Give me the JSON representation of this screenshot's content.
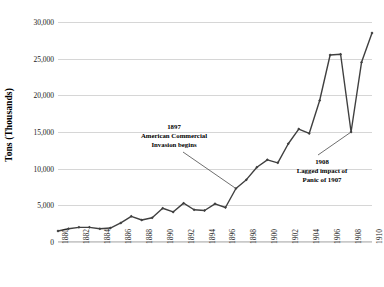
{
  "chart_data": {
    "type": "line",
    "title": "",
    "xlabel": "",
    "ylabel": "Tons (Thousands)",
    "ylim": [
      0,
      30000
    ],
    "xlim": [
      1880,
      1910
    ],
    "grid": true,
    "legend": "none",
    "y_ticks": [
      0,
      5000,
      10000,
      15000,
      20000,
      25000,
      30000
    ],
    "y_tick_labels": [
      "0",
      "5,000",
      "10,000",
      "15,000",
      "20,000",
      "25,000",
      "30,000"
    ],
    "x_tick_labels": [
      "1880",
      "1882",
      "1884",
      "1886",
      "1888",
      "1890",
      "1892",
      "1894",
      "1896",
      "1898",
      "1900",
      "1902",
      "1904",
      "1906",
      "1908",
      "1910"
    ],
    "x": [
      1880,
      1881,
      1882,
      1883,
      1884,
      1885,
      1886,
      1887,
      1888,
      1889,
      1890,
      1891,
      1892,
      1893,
      1894,
      1895,
      1896,
      1897,
      1898,
      1899,
      1900,
      1901,
      1902,
      1903,
      1904,
      1905,
      1906,
      1907,
      1908,
      1909,
      1910
    ],
    "values": [
      1500,
      1800,
      2000,
      2000,
      1800,
      1900,
      2600,
      3500,
      3000,
      3300,
      4600,
      4100,
      5300,
      4400,
      4300,
      5200,
      4700,
      7300,
      8500,
      10200,
      11200,
      10800,
      13400,
      15400,
      14800,
      19300,
      25500,
      25600,
      15000,
      24500,
      28500
    ],
    "series_label": "Tons (Thousands)",
    "series_color": "#404040",
    "marker": "diamond",
    "annotations": [
      {
        "id": "1897",
        "year": "1897",
        "line1": "American Commercial",
        "line2": "Invasion begins",
        "points_to_year": 1897
      },
      {
        "id": "1908",
        "year": "1908",
        "line1": "Lagged impact of",
        "line2": "Panic of 1907",
        "points_to_year": 1908
      }
    ]
  },
  "colors": {
    "series": "#404040",
    "gridline": "#d6d6d6",
    "text": "#1a1a1a",
    "background": "#ffffff"
  }
}
